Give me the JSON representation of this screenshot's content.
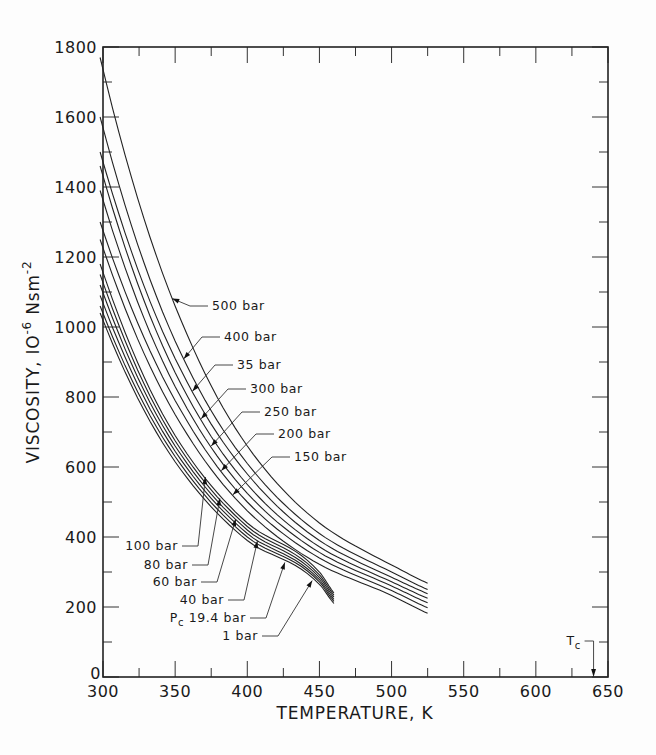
{
  "chart_data": {
    "type": "line",
    "title": "",
    "xlabel": "TEMPERATURE, K",
    "ylabel": "VISCOSITY, 10^-6 Nsm^-2",
    "ylabel_parts": {
      "main": "VISCOSITY, ",
      "base": "IO",
      "exp": "-6",
      "unit": " Nsm",
      "unit_exp": "-2"
    },
    "xlim": [
      300,
      650
    ],
    "ylim": [
      0,
      1800
    ],
    "x_ticks": [
      "300",
      "350",
      "400",
      "450",
      "500",
      "550",
      "600",
      "650"
    ],
    "y_ticks": [
      "0",
      "200",
      "400",
      "600",
      "800",
      "1000",
      "1200",
      "1400",
      "1600",
      "1800"
    ],
    "grid": false,
    "legend_position": "inline labels with leader arrows",
    "annotations": [
      {
        "text": "T",
        "sub": "c",
        "x": 640,
        "note": "critical temperature marker with downward arrow to x-axis"
      }
    ],
    "series": [
      {
        "name": "500 bar",
        "x": [
          298,
          350,
          400,
          450,
          500,
          525
        ],
        "values": [
          1770,
          1060,
          660,
          440,
          320,
          268
        ]
      },
      {
        "name": "400 bar",
        "x": [
          298,
          350,
          400,
          450,
          500,
          525
        ],
        "values": [
          1600,
          960,
          610,
          410,
          300,
          250
        ]
      },
      {
        "name": "35 bar",
        "x": [
          298,
          350,
          400,
          450,
          500,
          525
        ],
        "values": [
          1500,
          910,
          580,
          390,
          285,
          238
        ]
      },
      {
        "name": "300 bar",
        "x": [
          298,
          350,
          400,
          450,
          500,
          525
        ],
        "values": [
          1460,
          870,
          550,
          372,
          272,
          225
        ]
      },
      {
        "name": "250 bar",
        "x": [
          298,
          350,
          400,
          450,
          500,
          525
        ],
        "values": [
          1390,
          830,
          525,
          356,
          260,
          212
        ]
      },
      {
        "name": "200 bar",
        "x": [
          298,
          350,
          400,
          450,
          500,
          525
        ],
        "values": [
          1300,
          790,
          500,
          340,
          247,
          198
        ]
      },
      {
        "name": "150 bar",
        "x": [
          298,
          350,
          400,
          450,
          500,
          525
        ],
        "values": [
          1250,
          750,
          475,
          322,
          233,
          182
        ]
      },
      {
        "name": "100 bar",
        "x": [
          298,
          350,
          400,
          450,
          460
        ],
        "values": [
          1180,
          690,
          440,
          300,
          240
        ]
      },
      {
        "name": "80 bar",
        "x": [
          298,
          350,
          400,
          450,
          460
        ],
        "values": [
          1150,
          675,
          430,
          292,
          234
        ]
      },
      {
        "name": "60 bar",
        "x": [
          298,
          350,
          400,
          450,
          460
        ],
        "values": [
          1120,
          660,
          420,
          285,
          228
        ]
      },
      {
        "name": "40 bar",
        "x": [
          298,
          350,
          400,
          450,
          460
        ],
        "values": [
          1090,
          645,
          410,
          278,
          222
        ]
      },
      {
        "name": "Pc 19.4 bar",
        "x": [
          298,
          350,
          400,
          450,
          460
        ],
        "values": [
          1060,
          630,
          400,
          272,
          216
        ]
      },
      {
        "name": "1 bar",
        "x": [
          298,
          350,
          400,
          450,
          460
        ],
        "values": [
          1040,
          615,
          390,
          265,
          210
        ]
      }
    ]
  },
  "labels": {
    "upper": [
      {
        "text": "500 bar",
        "lx": 212,
        "ly": 310,
        "arrow_t": 348
      },
      {
        "text": "400 bar",
        "lx": 224,
        "ly": 341,
        "arrow_t": 356
      },
      {
        "text": "35 bar",
        "lx": 237,
        "ly": 369,
        "arrow_t": 362
      },
      {
        "text": "300 bar",
        "lx": 250,
        "ly": 393,
        "arrow_t": 368
      },
      {
        "text": "250 bar",
        "lx": 264,
        "ly": 416,
        "arrow_t": 375
      },
      {
        "text": "200 bar",
        "lx": 278,
        "ly": 438,
        "arrow_t": 382
      },
      {
        "text": "150 bar",
        "lx": 294,
        "ly": 461,
        "arrow_t": 390
      }
    ],
    "lower": [
      {
        "text": "100 bar",
        "rx": 178,
        "ry": 550,
        "arrow_t": 371
      },
      {
        "text": "80 bar",
        "rx": 188,
        "ry": 569,
        "arrow_t": 381
      },
      {
        "text": "60 bar",
        "rx": 197,
        "ry": 586,
        "arrow_t": 392
      },
      {
        "text": "40 bar",
        "rx": 224,
        "ry": 604,
        "arrow_t": 407
      },
      {
        "text_main": "P",
        "text_sub": "c",
        "text_rest": " 19.4 bar",
        "text": "Pc 19.4 bar",
        "rx": 246,
        "ry": 622,
        "arrow_t": 426
      },
      {
        "text": "1 bar",
        "rx": 258,
        "ry": 640,
        "arrow_t": 445
      }
    ]
  }
}
